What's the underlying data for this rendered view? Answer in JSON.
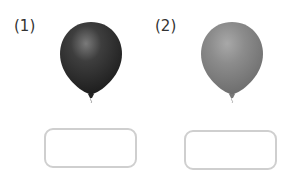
{
  "items": [
    {
      "label": "(1)",
      "balloon_color": "#3a3a3a",
      "answer": ""
    },
    {
      "label": "(2)",
      "balloon_color": "#8a8a8a",
      "answer": ""
    }
  ]
}
